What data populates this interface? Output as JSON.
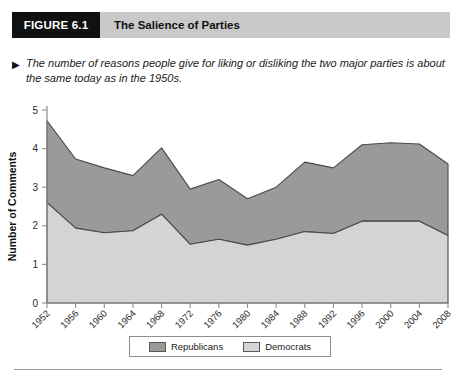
{
  "figure": {
    "number_label": "FIGURE 6.1",
    "title": "The Salience of Parties",
    "caption_marker": "▶",
    "caption": "The number of reasons people give for liking or disliking the two major parties is about the same today as in the 1950s."
  },
  "legend": {
    "position": "bottom-center",
    "entries": [
      {
        "label": "Republicans",
        "color": "#9a9a9a"
      },
      {
        "label": "Democrats",
        "color": "#d4d4d4"
      }
    ]
  },
  "colors": {
    "header_bar": "#c9c9c9",
    "header_box": "#111111",
    "republicans_fill": "#9a9a9a",
    "democrats_fill": "#d4d4d4",
    "outline": "#4a4a4a",
    "axis": "#8d8d8d"
  },
  "chart_data": {
    "type": "area",
    "stacked": true,
    "title": "The Salience of Parties",
    "xlabel": "",
    "ylabel": "Number of Comments",
    "ylim": [
      0,
      5
    ],
    "yticks": [
      0,
      1,
      2,
      3,
      4,
      5
    ],
    "grid": false,
    "legend_position": "bottom-center",
    "categories": [
      "1952",
      "1956",
      "1960",
      "1964",
      "1968",
      "1972",
      "1976",
      "1980",
      "1984",
      "1988",
      "1992",
      "1996",
      "2000",
      "2004",
      "2008"
    ],
    "series": [
      {
        "name": "Democrats",
        "color": "#d4d4d4",
        "values": [
          2.6,
          1.94,
          1.82,
          1.87,
          2.3,
          1.52,
          1.65,
          1.5,
          1.65,
          1.85,
          1.8,
          2.12,
          2.12,
          2.12,
          1.75
        ]
      },
      {
        "name": "Republicans",
        "color": "#9a9a9a",
        "values": [
          2.12,
          1.79,
          1.68,
          1.43,
          1.72,
          1.43,
          1.55,
          1.2,
          1.35,
          1.8,
          1.7,
          1.98,
          2.03,
          2.0,
          1.85
        ]
      }
    ],
    "totals": [
      4.72,
      3.73,
      3.5,
      3.3,
      4.02,
      2.95,
      3.2,
      2.7,
      3.0,
      3.65,
      3.5,
      4.1,
      4.15,
      4.12,
      3.6
    ]
  }
}
